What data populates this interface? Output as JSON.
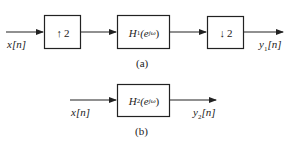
{
  "diagram_a": {
    "caption": "(a)",
    "input_label": "x[n]",
    "output_label": "y1[n]",
    "output_label_base": "y",
    "output_label_sub": "1",
    "output_label_arg": "[n]",
    "blocks": [
      {
        "id": "upsampler",
        "symbol": "↑",
        "factor": "2"
      },
      {
        "id": "filter_h1",
        "name": "H",
        "sub": "1",
        "arg_open": "(e",
        "exp": "jω",
        "arg_close": ")"
      },
      {
        "id": "downsampler",
        "symbol": "↓",
        "factor": "2"
      }
    ]
  },
  "diagram_b": {
    "caption": "(b)",
    "input_label": "x[n]",
    "output_label_base": "y",
    "output_label_sub": "2",
    "output_label_arg": "[n]",
    "blocks": [
      {
        "id": "filter_h2",
        "name": "H",
        "sub": "2",
        "arg_open": "(e",
        "exp": "jω",
        "arg_close": ")"
      }
    ]
  }
}
